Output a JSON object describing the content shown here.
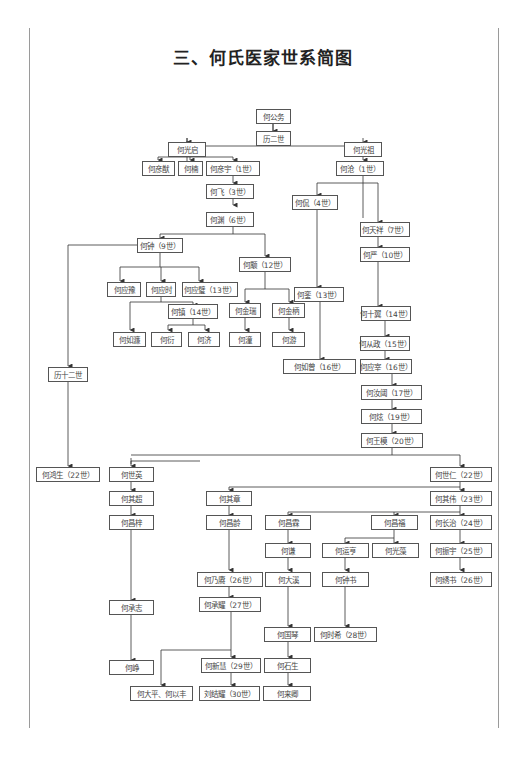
{
  "title": "三、何氏医家世系简图",
  "colors": {
    "line": "#333333",
    "box_border": "#555555",
    "text": "#444444",
    "page_border": "#9a9a9a"
  },
  "nodes": {
    "n01": "何公务",
    "n02": "历二世",
    "n03": "何光启",
    "n04": "何光祖",
    "n05": "何彦猷",
    "n06": "何楠",
    "n07": "何彦宇（1世）",
    "n08": "何沧（1世）",
    "n09": "何飞（3世）",
    "n10": "何渊（6世）",
    "n11": "何侃（4世）",
    "n12": "何天祥（7世）",
    "n13": "何钟（9世）",
    "n14": "何严（10世）",
    "n15": "何颙（12世）",
    "n16": "何应豫",
    "n17": "何应时",
    "n18": "何应璧（13世）",
    "n19": "何銮（13世）",
    "n20": "何镇（14世）",
    "n21": "何金瑞",
    "n22": "何金柄",
    "n23": "何十翼（14世）",
    "n24": "何如濂",
    "n25": "何衍",
    "n26": "何济",
    "n27": "何潼",
    "n28": "何游",
    "n29": "何从政（15世）",
    "n30": "何如曾（16世）",
    "n31": "何应宰（16世）",
    "n32": "历十二世",
    "n33": "何汝阈（17世）",
    "n34": "何炫（19世）",
    "n35": "何王模（20世）",
    "n36": "何鸿生（22世）",
    "n37": "何世英",
    "n38": "何世仁（22世）",
    "n39": "何其超",
    "n40": "何其章",
    "n41": "何其伟（23世）",
    "n42": "何昌梓",
    "n43": "何昌龄",
    "n44": "何昌霖",
    "n45": "何昌福",
    "n46": "何长治（24世）",
    "n47": "何谦",
    "n48": "何运亨",
    "n49": "何光藻",
    "n50": "何振宇（25世）",
    "n51": "何乃赓（26世）",
    "n52": "何大溪",
    "n53": "何钟书",
    "n54": "何绣书（26世）",
    "n55": "何承志",
    "n56": "何承耀（27世）",
    "n57": "何国琴",
    "n58": "何时希（28世）",
    "n59": "何峥",
    "n60": "何新慧（29世）",
    "n61": "何石生",
    "n62": "何大平、何以丰",
    "n63": "刘结耀（30世）",
    "n64": "何来卿"
  }
}
